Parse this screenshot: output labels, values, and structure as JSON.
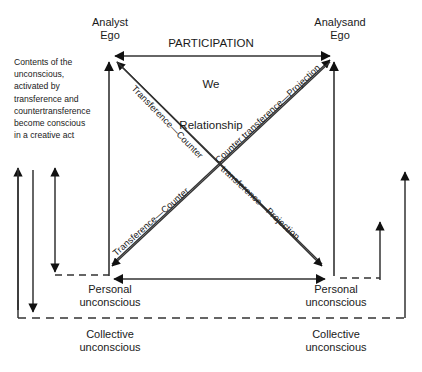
{
  "diagram": {
    "title": {
      "line1": "PARTICIPATION",
      "line2": "We",
      "line3": "Relationship"
    },
    "nodes": {
      "analyst_ego": "Analyst\nEgo",
      "analysand_ego": "Analysand\nEgo",
      "personal_unconscious_left": "Personal\nunconscious",
      "personal_unconscious_right": "Personal\nunconscious",
      "collective_unconscious_left": "Collective\nunconscious",
      "collective_unconscious_right": "Collective\nunconscious"
    },
    "side_note": "Contents of the\nunconscious,\nactivated by\ntransference and\ncountertransference\nbecome conscious\nin a creative act",
    "edge_labels": {
      "upper_left_diagonal": "Transference—Counter",
      "upper_right_diagonal": "Counter transference—Projection",
      "lower_left_diagonal": "Transference—Counter",
      "lower_right_diagonal": "transference—Projection"
    },
    "colors": {
      "stroke": "#333333",
      "text": "#1a1a1a",
      "background": "#ffffff",
      "arrowhead": "#111111"
    }
  }
}
